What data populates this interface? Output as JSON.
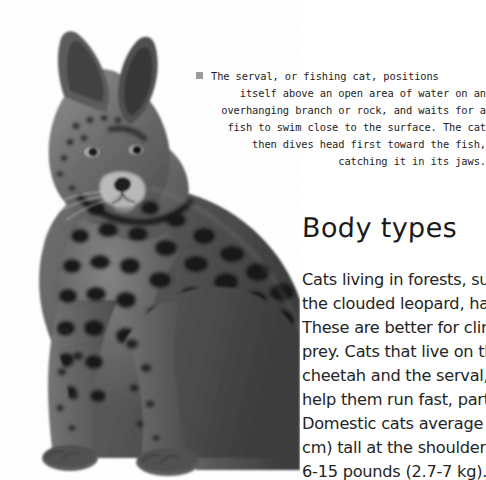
{
  "page": {
    "background_color": "#ffffff",
    "width": 486,
    "height": 480
  },
  "photo": {
    "name": "serval-photograph",
    "subject": "serval cat",
    "style": "grayscale photograph",
    "alt": "A grayscale photograph of a serval, a spotted wild cat, sitting upright and facing left"
  },
  "caption": {
    "bullet_icon": "gray-square-bullet",
    "bullet_color": "#9a9a9a",
    "text_color": "#1d1d1d",
    "lines": [
      "The serval, or fishing cat, positions",
      "itself above an open area of water on an",
      "overhanging branch or rock, and waits for a",
      "fish to swim close to the surface. The cat",
      "then dives head first toward the fish,",
      "catching it in its jaws."
    ],
    "full_text": "The serval, or fishing cat, positions itself above an open area of water on an overhanging branch or rock, and waits for a fish to swim close to the surface. The cat then dives head first toward the fish, catching it in its jaws."
  },
  "section": {
    "heading": "Body types",
    "heading_color": "#1a1a1a",
    "body_color": "#252525",
    "body_lines": [
      "Cats living in forests, suc",
      "the clouded leopard, hav",
      "These are better for clim",
      "prey. Cats that live on th",
      "cheetah and the serval, h",
      "help them run fast, partic",
      "Domestic cats average a",
      "cm) tall at the shoulder a",
      "6-15 pounds (2.7-7 kg)."
    ]
  }
}
